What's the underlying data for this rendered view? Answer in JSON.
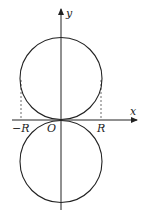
{
  "diagram": {
    "type": "two circles tangent at origin",
    "axes": {
      "x_label": "x",
      "y_label": "y",
      "origin_label": "O"
    },
    "tick_labels": {
      "neg_r": "−R",
      "pos_r": "R"
    },
    "shapes": [
      {
        "name": "upper-circle",
        "center": [
          0,
          "R"
        ],
        "radius": "R"
      },
      {
        "name": "lower-circle",
        "center": [
          0,
          "-R"
        ],
        "radius": "R"
      }
    ],
    "guides": [
      {
        "name": "dashed-line-neg-r",
        "x": "-R"
      },
      {
        "name": "dashed-line-pos-r",
        "x": "R"
      }
    ],
    "colors": {
      "stroke": "#222222",
      "background": "#ffffff"
    }
  }
}
